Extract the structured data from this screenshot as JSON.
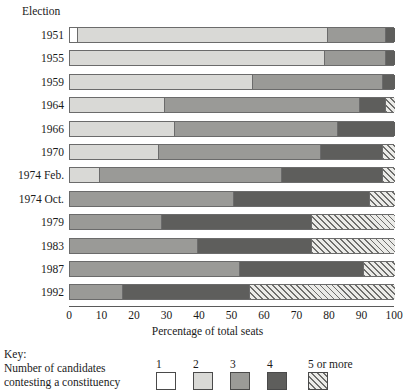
{
  "axis": {
    "y_title": "Election",
    "x_title": "Percentage of total seats",
    "x_ticks": [
      "0",
      "10",
      "20",
      "30",
      "40",
      "50",
      "60",
      "70",
      "80",
      "90",
      "100"
    ]
  },
  "key": {
    "word": "Key:",
    "description_line1": "Number of candidates",
    "description_line2": "contesting a constituency",
    "items": [
      {
        "label": "1",
        "swatch": "white-swatch",
        "color": "#ffffff"
      },
      {
        "label": "2",
        "swatch": "light-grey-swatch",
        "color": "#d9d9d6"
      },
      {
        "label": "3",
        "swatch": "mid-grey-swatch",
        "color": "#9a9a97"
      },
      {
        "label": "4",
        "swatch": "dark-grey-swatch",
        "color": "#5e5e5c"
      },
      {
        "label": "5 or more",
        "swatch": "hatched-swatch",
        "color": "#6e6e6c"
      }
    ]
  },
  "chart_data": {
    "type": "bar",
    "orientation": "horizontal",
    "stacked": true,
    "percent": true,
    "title": "",
    "xlabel": "Percentage of total seats",
    "ylabel": "Election",
    "xlim": [
      0,
      100
    ],
    "grid": false,
    "legend_position": "bottom",
    "categories": [
      "1951",
      "1955",
      "1959",
      "1964",
      "1966",
      "1970",
      "1974 Feb.",
      "1974 Oct.",
      "1979",
      "1983",
      "1987",
      "1992"
    ],
    "series": [
      {
        "name": "1",
        "values": [
          2,
          0,
          0,
          0,
          0,
          0,
          0,
          0,
          0,
          0,
          0,
          0
        ]
      },
      {
        "name": "2",
        "values": [
          77,
          78,
          56,
          29,
          32,
          27,
          9,
          0,
          0,
          0,
          0,
          0
        ]
      },
      {
        "name": "3",
        "values": [
          18,
          19,
          40,
          60,
          50,
          50,
          56,
          50,
          28,
          39,
          52,
          16
        ]
      },
      {
        "name": "4",
        "values": [
          3,
          3,
          4,
          8,
          18,
          19,
          31,
          42,
          46,
          35,
          38,
          39
        ]
      },
      {
        "name": "5 or more",
        "values": [
          0,
          0,
          0,
          3,
          0,
          4,
          4,
          8,
          26,
          26,
          10,
          45
        ]
      }
    ]
  }
}
